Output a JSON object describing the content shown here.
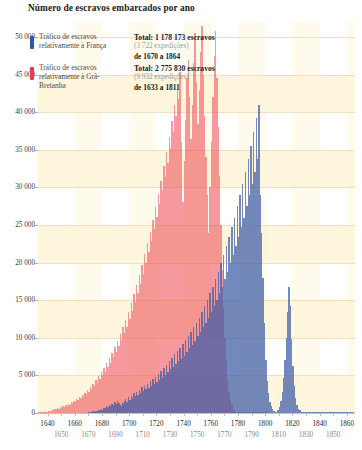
{
  "chart_data": {
    "type": "bar",
    "title": "Número de escravos embarcados por ano",
    "xlabel": "",
    "ylabel": "",
    "ylim": [
      0,
      52000
    ],
    "xlim": [
      1633,
      1866
    ],
    "grid": true,
    "legend_position": "top-left",
    "y_ticks": [
      "0",
      "5 000",
      "10 000",
      "15 000",
      "20 000",
      "25 000",
      "30 000",
      "35 000",
      "40 000",
      "45 000",
      "50 000"
    ],
    "y_tick_values": [
      0,
      5000,
      10000,
      15000,
      20000,
      25000,
      30000,
      35000,
      40000,
      45000,
      50000
    ],
    "x_ticks_upper": [
      "1640",
      "1660",
      "1680",
      "1700",
      "1720",
      "1740",
      "1760",
      "1780",
      "1800",
      "1820",
      "1840",
      "1860"
    ],
    "x_ticks_lower": [
      "1650",
      "1670",
      "1690",
      "1710",
      "1730",
      "1750",
      "1770",
      "1790",
      "1810",
      "1830",
      "1850"
    ],
    "series": [
      {
        "name": "Tráfico de escravos relativamente à França",
        "color": "#2f58a8",
        "x_start": 1670,
        "values": [
          120,
          80,
          160,
          210,
          90,
          300,
          260,
          410,
          380,
          520,
          460,
          700,
          640,
          880,
          760,
          1100,
          980,
          1250,
          1020,
          1400,
          1180,
          1560,
          1320,
          1050,
          900,
          1380,
          1600,
          1900,
          1450,
          2100,
          1750,
          2300,
          1980,
          2600,
          2200,
          2850,
          2450,
          3100,
          2700,
          3400,
          2900,
          3600,
          3150,
          3900,
          3300,
          4200,
          3600,
          4500,
          3850,
          4800,
          4100,
          5200,
          4400,
          5600,
          4700,
          6000,
          5100,
          6400,
          5400,
          6900,
          5800,
          7300,
          6100,
          7800,
          6500,
          8200,
          6900,
          8700,
          7200,
          9200,
          7600,
          9700,
          8100,
          10200,
          8600,
          10800,
          9100,
          11400,
          9600,
          12000,
          10200,
          12700,
          10800,
          13400,
          11400,
          14200,
          12000,
          15000,
          12700,
          15900,
          13400,
          16800,
          14200,
          17800,
          15000,
          18800,
          15900,
          19900,
          16800,
          21000,
          17800,
          22200,
          18800,
          23400,
          19900,
          24700,
          21000,
          26000,
          22200,
          27500,
          23400,
          29000,
          24700,
          30500,
          26000,
          32000,
          27500,
          33800,
          29000,
          35500,
          30500,
          37400,
          32000,
          39200,
          33800,
          41000,
          29000,
          24000,
          18000,
          12000,
          7000,
          4200,
          2600,
          1500,
          900,
          500,
          300,
          200,
          150,
          400,
          800,
          1600,
          2800,
          4600,
          7000,
          10000,
          13500,
          16800,
          14200,
          9800,
          6200,
          3600,
          2000,
          1100,
          600,
          350,
          200,
          120,
          90,
          70,
          60,
          50,
          45,
          40,
          35,
          30,
          28,
          26,
          24,
          22,
          20,
          18,
          16,
          15,
          14,
          13,
          12,
          11,
          10,
          9,
          8,
          8,
          7,
          7,
          6,
          6,
          5,
          5,
          4,
          4,
          3,
          3,
          3,
          2,
          2
        ]
      },
      {
        "name": "Tráfico de escravos relativamente à Grã-Bretanha",
        "color": "#ef3b48",
        "x_start": 1633,
        "values": [
          60,
          90,
          140,
          110,
          180,
          220,
          160,
          280,
          320,
          250,
          400,
          360,
          520,
          480,
          640,
          580,
          760,
          700,
          900,
          820,
          1050,
          960,
          1200,
          1100,
          1400,
          1280,
          1600,
          1480,
          1850,
          1700,
          2100,
          1950,
          2400,
          2200,
          2700,
          2500,
          3100,
          2850,
          3500,
          3200,
          3900,
          3600,
          4400,
          4000,
          4900,
          4500,
          5400,
          5000,
          6000,
          5500,
          6600,
          6100,
          7300,
          6700,
          8000,
          7400,
          8800,
          8100,
          9600,
          8900,
          10500,
          9700,
          11400,
          10600,
          12400,
          11500,
          13500,
          12500,
          14600,
          13600,
          15800,
          14700,
          17000,
          15900,
          18300,
          17200,
          19700,
          18500,
          21100,
          19900,
          22600,
          21400,
          24100,
          22900,
          25700,
          24500,
          27400,
          26100,
          29100,
          27800,
          30900,
          29600,
          32800,
          31400,
          34700,
          33300,
          36700,
          35300,
          38800,
          37400,
          40900,
          39500,
          43100,
          41700,
          45400,
          36000,
          28000,
          33500,
          39000,
          44500,
          47000,
          42000,
          36500,
          41000,
          46500,
          50500,
          44000,
          38500,
          43000,
          48000,
          51500,
          45000,
          39500,
          34000,
          29000,
          24000,
          30000,
          36000,
          42000,
          47500,
          50800,
          44500,
          38000,
          31500,
          25000,
          19000,
          14000,
          10000,
          7000,
          4500,
          2800,
          1700,
          1000,
          600,
          350,
          200,
          120,
          80,
          50,
          30,
          20,
          15,
          10,
          8,
          6,
          5,
          4,
          3,
          2,
          2,
          1,
          1,
          1,
          1,
          1,
          1,
          1,
          1,
          1
        ]
      }
    ],
    "annotations": [
      {
        "series": "france",
        "total_label": "Total: 1 178 173 escravos",
        "expeditions": "(3 722 expedições)",
        "range": "de 1670 a 1864"
      },
      {
        "series": "britain",
        "total_label": "Total: 2 775 830 escravos",
        "expeditions": "(9 932 expedições)",
        "range": "de 1633 a 1811"
      }
    ]
  },
  "legend": {
    "france": {
      "label": "Tráfico de escravos relativamente à França",
      "total": "Total: 1 178 173 escravos",
      "expeditions": "(3 722 expedições)",
      "range": "de 1670 a 1864",
      "color": "#2f58a8",
      "swatch_name": "france-color-swatch"
    },
    "britain": {
      "label": "Tráfico de escravos relativamente à Grã-Bretanha",
      "total": "Total: 2 775 830 escravos",
      "expeditions": "(9 932 expedições)",
      "range": "de 1633 a 1811",
      "color": "#ef3b48",
      "swatch_name": "britain-color-swatch"
    }
  },
  "colors": {
    "france_bar": "#3b5ca8",
    "britain_bar": "#ef4a52",
    "band": "#fdf6dc",
    "gridline": "#f0d9b8",
    "background": "#ffffff",
    "text": "#1a1a1a"
  }
}
